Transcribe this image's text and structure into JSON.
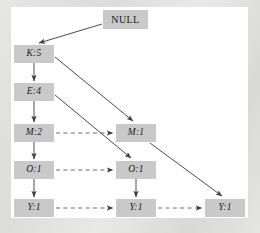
{
  "figure": {
    "background_color": "#ffffff",
    "frame_color": "#e2e2e0",
    "node_fill": "#c9c9c9",
    "edge_color": "#4a4a4a"
  },
  "nodes": [
    {
      "id": "null",
      "label": "NULL",
      "x": 103,
      "y": 10,
      "w": 45,
      "h": 19,
      "style": "root"
    },
    {
      "id": "k5",
      "label": "K:5",
      "x": 14,
      "y": 45,
      "w": 40,
      "h": 18,
      "style": "item"
    },
    {
      "id": "e4",
      "label": "E:4",
      "x": 14,
      "y": 83,
      "w": 40,
      "h": 18,
      "style": "item"
    },
    {
      "id": "m2",
      "label": "M:2",
      "x": 14,
      "y": 124,
      "w": 40,
      "h": 18,
      "style": "item"
    },
    {
      "id": "o1a",
      "label": "O:1",
      "x": 14,
      "y": 161,
      "w": 40,
      "h": 18,
      "style": "item"
    },
    {
      "id": "y1a",
      "label": "Y:1",
      "x": 14,
      "y": 199,
      "w": 40,
      "h": 18,
      "style": "item"
    },
    {
      "id": "m1",
      "label": "M:1",
      "x": 116,
      "y": 124,
      "w": 40,
      "h": 18,
      "style": "item"
    },
    {
      "id": "o1b",
      "label": "O:1",
      "x": 116,
      "y": 161,
      "w": 40,
      "h": 18,
      "style": "item"
    },
    {
      "id": "y1b",
      "label": "Y:1",
      "x": 116,
      "y": 199,
      "w": 40,
      "h": 18,
      "style": "item"
    },
    {
      "id": "y1c",
      "label": "Y:1",
      "x": 205,
      "y": 199,
      "w": 40,
      "h": 18,
      "style": "item"
    }
  ],
  "edges": [
    {
      "from": "null",
      "to": "k5",
      "kind": "tree",
      "line": "solid"
    },
    {
      "from": "k5",
      "to": "e4",
      "kind": "tree",
      "line": "solid"
    },
    {
      "from": "e4",
      "to": "m2",
      "kind": "tree",
      "line": "solid"
    },
    {
      "from": "m2",
      "to": "o1a",
      "kind": "tree",
      "line": "solid"
    },
    {
      "from": "o1a",
      "to": "y1a",
      "kind": "tree",
      "line": "solid"
    },
    {
      "from": "k5",
      "to": "m1",
      "kind": "tree",
      "line": "solid"
    },
    {
      "from": "e4",
      "to": "o1b",
      "kind": "tree",
      "line": "solid"
    },
    {
      "from": "o1b",
      "to": "y1b",
      "kind": "tree",
      "line": "solid"
    },
    {
      "from": "m1",
      "to": "y1c",
      "kind": "tree",
      "line": "solid"
    },
    {
      "from": "m2",
      "to": "m1",
      "kind": "node-link",
      "line": "dashed"
    },
    {
      "from": "o1a",
      "to": "o1b",
      "kind": "node-link",
      "line": "dashed"
    },
    {
      "from": "y1a",
      "to": "y1b",
      "kind": "node-link",
      "line": "dashed"
    },
    {
      "from": "y1b",
      "to": "y1c",
      "kind": "node-link",
      "line": "dashed"
    }
  ]
}
